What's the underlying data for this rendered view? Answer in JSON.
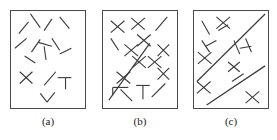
{
  "figure": {
    "background_color": "#ffffff",
    "stroke_color": "#3b3b3b",
    "border_color": "#4a4a4a",
    "panel_count": 3
  },
  "panels": [
    {
      "id": "panel-a",
      "caption": "(a)",
      "box": {
        "x": 10,
        "y": 10,
        "width": 76,
        "height": 99
      },
      "description": "randomly oriented short line segments, no alignment",
      "segments": [
        {
          "x1": 18,
          "y1": 33,
          "x2": 28,
          "y2": 21
        },
        {
          "x1": 30,
          "y1": 13,
          "x2": 40,
          "y2": 27
        },
        {
          "x1": 44,
          "y1": 30,
          "x2": 52,
          "y2": 18
        },
        {
          "x1": 60,
          "y1": 16,
          "x2": 70,
          "y2": 28
        },
        {
          "x1": 14,
          "y1": 48,
          "x2": 26,
          "y2": 38
        },
        {
          "x1": 31,
          "y1": 52,
          "x2": 40,
          "y2": 39
        },
        {
          "x1": 38,
          "y1": 42,
          "x2": 52,
          "y2": 46
        },
        {
          "x1": 52,
          "y1": 38,
          "x2": 60,
          "y2": 50
        },
        {
          "x1": 44,
          "y1": 46,
          "x2": 46,
          "y2": 60
        },
        {
          "x1": 24,
          "y1": 56,
          "x2": 35,
          "y2": 63
        },
        {
          "x1": 60,
          "y1": 54,
          "x2": 72,
          "y2": 48
        },
        {
          "x1": 19,
          "y1": 72,
          "x2": 32,
          "y2": 84
        },
        {
          "x1": 32,
          "y1": 72,
          "x2": 19,
          "y2": 84
        },
        {
          "x1": 44,
          "y1": 86,
          "x2": 56,
          "y2": 72
        },
        {
          "x1": 58,
          "y1": 78,
          "x2": 72,
          "y2": 78
        },
        {
          "x1": 66,
          "y1": 78,
          "x2": 66,
          "y2": 90
        },
        {
          "x1": 40,
          "y1": 94,
          "x2": 47,
          "y2": 103
        },
        {
          "x1": 47,
          "y1": 103,
          "x2": 55,
          "y2": 93
        }
      ]
    },
    {
      "id": "panel-b",
      "caption": "(b)",
      "box": {
        "x": 102,
        "y": 10,
        "width": 76,
        "height": 99
      },
      "description": "crosses arranged along a long diagonal line",
      "long_lines": [
        {
          "x1": 108,
          "y1": 101,
          "x2": 150,
          "y2": 43
        }
      ],
      "segments": [
        {
          "x1": 110,
          "y1": 20,
          "x2": 124,
          "y2": 32
        },
        {
          "x1": 124,
          "y1": 20,
          "x2": 110,
          "y2": 32
        },
        {
          "x1": 131,
          "y1": 17,
          "x2": 145,
          "y2": 29
        },
        {
          "x1": 145,
          "y1": 17,
          "x2": 131,
          "y2": 29
        },
        {
          "x1": 156,
          "y1": 30,
          "x2": 168,
          "y2": 16
        },
        {
          "x1": 110,
          "y1": 38,
          "x2": 118,
          "y2": 50
        },
        {
          "x1": 137,
          "y1": 34,
          "x2": 151,
          "y2": 46
        },
        {
          "x1": 151,
          "y1": 34,
          "x2": 137,
          "y2": 46
        },
        {
          "x1": 124,
          "y1": 44,
          "x2": 138,
          "y2": 56
        },
        {
          "x1": 138,
          "y1": 44,
          "x2": 124,
          "y2": 56
        },
        {
          "x1": 158,
          "y1": 44,
          "x2": 170,
          "y2": 56
        },
        {
          "x1": 170,
          "y1": 44,
          "x2": 158,
          "y2": 56
        },
        {
          "x1": 132,
          "y1": 56,
          "x2": 146,
          "y2": 68
        },
        {
          "x1": 146,
          "y1": 56,
          "x2": 132,
          "y2": 68
        },
        {
          "x1": 148,
          "y1": 56,
          "x2": 162,
          "y2": 68
        },
        {
          "x1": 162,
          "y1": 56,
          "x2": 148,
          "y2": 68
        },
        {
          "x1": 158,
          "y1": 68,
          "x2": 170,
          "y2": 80
        },
        {
          "x1": 170,
          "y1": 68,
          "x2": 158,
          "y2": 80
        },
        {
          "x1": 116,
          "y1": 72,
          "x2": 130,
          "y2": 84
        },
        {
          "x1": 130,
          "y1": 72,
          "x2": 116,
          "y2": 84
        },
        {
          "x1": 112,
          "y1": 88,
          "x2": 128,
          "y2": 88
        },
        {
          "x1": 112,
          "y1": 88,
          "x2": 112,
          "y2": 96
        },
        {
          "x1": 120,
          "y1": 90,
          "x2": 132,
          "y2": 102
        },
        {
          "x1": 136,
          "y1": 86,
          "x2": 150,
          "y2": 86
        },
        {
          "x1": 143,
          "y1": 86,
          "x2": 143,
          "y2": 100
        },
        {
          "x1": 152,
          "y1": 98,
          "x2": 166,
          "y2": 84
        }
      ]
    },
    {
      "id": "panel-c",
      "caption": "(c)",
      "box": {
        "x": 193,
        "y": 10,
        "width": 76,
        "height": 99
      },
      "description": "two long parallel diagonal lines with scattered crosses and segments",
      "long_lines": [
        {
          "x1": 196,
          "y1": 82,
          "x2": 266,
          "y2": 13
        },
        {
          "x1": 206,
          "y1": 106,
          "x2": 266,
          "y2": 66
        }
      ],
      "segments": [
        {
          "x1": 201,
          "y1": 20,
          "x2": 209,
          "y2": 34
        },
        {
          "x1": 216,
          "y1": 16,
          "x2": 230,
          "y2": 28
        },
        {
          "x1": 230,
          "y1": 16,
          "x2": 216,
          "y2": 28
        },
        {
          "x1": 218,
          "y1": 30,
          "x2": 228,
          "y2": 24
        },
        {
          "x1": 201,
          "y1": 40,
          "x2": 209,
          "y2": 52
        },
        {
          "x1": 205,
          "y1": 46,
          "x2": 216,
          "y2": 40
        },
        {
          "x1": 197,
          "y1": 52,
          "x2": 211,
          "y2": 64
        },
        {
          "x1": 211,
          "y1": 52,
          "x2": 197,
          "y2": 64
        },
        {
          "x1": 234,
          "y1": 40,
          "x2": 240,
          "y2": 54
        },
        {
          "x1": 246,
          "y1": 38,
          "x2": 252,
          "y2": 52
        },
        {
          "x1": 240,
          "y1": 48,
          "x2": 252,
          "y2": 46
        },
        {
          "x1": 228,
          "y1": 62,
          "x2": 240,
          "y2": 72
        },
        {
          "x1": 240,
          "y1": 62,
          "x2": 228,
          "y2": 72
        },
        {
          "x1": 196,
          "y1": 82,
          "x2": 210,
          "y2": 94
        },
        {
          "x1": 210,
          "y1": 82,
          "x2": 196,
          "y2": 94
        },
        {
          "x1": 232,
          "y1": 82,
          "x2": 244,
          "y2": 74
        },
        {
          "x1": 246,
          "y1": 92,
          "x2": 260,
          "y2": 104
        },
        {
          "x1": 260,
          "y1": 92,
          "x2": 246,
          "y2": 104
        }
      ]
    }
  ],
  "captions": {
    "a": "(a)",
    "b": "(b)",
    "c": "(c)"
  }
}
